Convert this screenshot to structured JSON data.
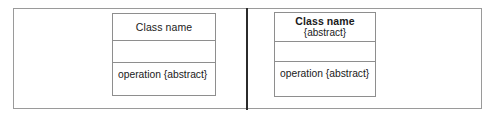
{
  "figure": {
    "background_color": "#ffffff",
    "frame_color": "#9a9a9a",
    "divider_color": "#2b2b2b",
    "box_border_color": "#8e8e8e",
    "text_color": "#1a1a1a"
  },
  "panels": {
    "left": {
      "class_box": {
        "name_compartment": {
          "title": "Class name",
          "title_bold": false,
          "stereotype": ""
        },
        "attribute_compartment": {
          "items": []
        },
        "operation_compartment": {
          "items": [
            "operation {abstract}"
          ]
        }
      }
    },
    "right": {
      "class_box": {
        "name_compartment": {
          "title": "Class name",
          "title_bold": true,
          "stereotype": "{abstract}"
        },
        "attribute_compartment": {
          "items": []
        },
        "operation_compartment": {
          "items": [
            "operation {abstract}"
          ]
        }
      }
    }
  }
}
